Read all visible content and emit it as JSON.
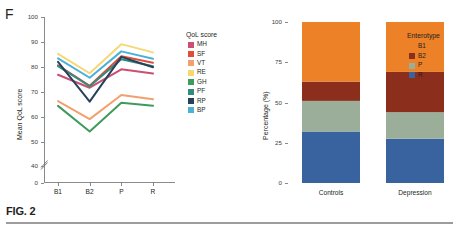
{
  "figure": {
    "caption": "FIG. 2",
    "panels": [
      {
        "letter": "F"
      },
      {
        "letter": "G"
      }
    ]
  },
  "panel_f": {
    "letter": "F",
    "legend_title": "QoL score",
    "chart_data": {
      "type": "line",
      "title": "",
      "xlabel": "",
      "ylabel": "Mean QoL score",
      "categories": [
        "B1",
        "B2",
        "P",
        "R"
      ],
      "xtick_labels": [
        "B1",
        "B2",
        "P",
        "R"
      ],
      "ytick_labels": [
        "0",
        "40",
        "50",
        "60",
        "70",
        "80",
        "90",
        "100"
      ],
      "ytick_values": [
        0,
        40,
        50,
        60,
        70,
        80,
        90,
        100
      ],
      "ylim": [
        36,
        100
      ],
      "axis_break": true,
      "grid": false,
      "legend_position": "right",
      "series": [
        {
          "name": "MH",
          "color": "#c94f74",
          "values": [
            76.8,
            71.6,
            79.0,
            77.3
          ]
        },
        {
          "name": "SF",
          "color": "#e24b39",
          "values": [
            80.6,
            72.4,
            84.2,
            81.6
          ]
        },
        {
          "name": "VT",
          "color": "#f2a070",
          "values": [
            66.2,
            59.0,
            68.7,
            67.0
          ]
        },
        {
          "name": "RE",
          "color": "#f6d873",
          "values": [
            85.2,
            77.4,
            89.1,
            85.8
          ]
        },
        {
          "name": "GH",
          "color": "#3f9a5e",
          "values": [
            64.3,
            54.0,
            65.6,
            64.4
          ]
        },
        {
          "name": "PF",
          "color": "#2f8d7e",
          "values": [
            80.3,
            72.2,
            83.0,
            80.2
          ]
        },
        {
          "name": "RP",
          "color": "#27405c",
          "values": [
            82.0,
            66.0,
            84.0,
            79.8
          ]
        },
        {
          "name": "BP",
          "color": "#4cb1d8",
          "values": [
            83.4,
            75.6,
            86.2,
            83.2
          ]
        }
      ]
    }
  },
  "panel_g": {
    "letter": "G",
    "legend_title": "Enterotype",
    "chart_data": {
      "type": "bar",
      "stacked": true,
      "title": "",
      "xlabel": "",
      "ylabel": "Percentage (%)",
      "categories": [
        "Controls",
        "Depression"
      ],
      "xtick_labels": [
        "Controls",
        "Depression"
      ],
      "ytick_labels": [
        "0",
        "25",
        "50",
        "75",
        "100"
      ],
      "ytick_values": [
        0,
        25,
        50,
        75,
        100
      ],
      "ylim": [
        0,
        100
      ],
      "grid": false,
      "legend_position": "right",
      "series": [
        {
          "name": "B1",
          "color": "#ec8127",
          "values": [
            37.0,
            31.0
          ]
        },
        {
          "name": "B2",
          "color": "#8b2f1c",
          "values": [
            12.0,
            25.0
          ]
        },
        {
          "name": "P",
          "color": "#9bae9a",
          "values": [
            19.0,
            16.5
          ]
        },
        {
          "name": "R",
          "color": "#39639f",
          "values": [
            32.0,
            27.5
          ]
        }
      ]
    }
  }
}
